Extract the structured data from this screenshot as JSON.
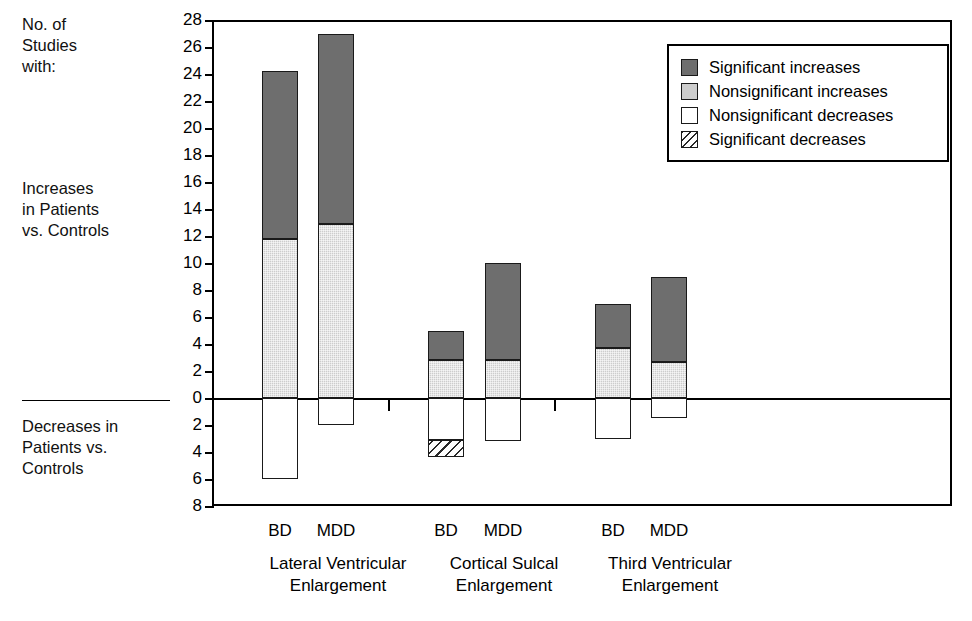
{
  "annotations": {
    "top_label": "No. of\nStudies\nwith:",
    "middle_label": "Increases\nin Patients\nvs. Controls",
    "bottom_label": "Decreases in\nPatients vs.\nControls"
  },
  "legend": {
    "position": "top-right",
    "items": [
      {
        "label": "Significant increases",
        "key": "sig-inc",
        "color": "#6e6e6e"
      },
      {
        "label": "Nonsignificant increases",
        "key": "nonsig-inc",
        "color": "#cdcdcd"
      },
      {
        "label": "Nonsignificant decreases",
        "key": "nonsig-dec",
        "color": "#ffffff"
      },
      {
        "label": "Significant decreases",
        "key": "sig-dec",
        "color": "#ffffff"
      }
    ]
  },
  "chart_data": {
    "type": "bar",
    "stacked": true,
    "title": "",
    "xlabel": "",
    "ylabel": "No. of Studies with:",
    "ylim": [
      -8,
      28
    ],
    "ytick_step": 2,
    "ytick_labels": [
      "28",
      "26",
      "24",
      "22",
      "20",
      "18",
      "16",
      "14",
      "12",
      "10",
      "8",
      "6",
      "4",
      "2",
      "0",
      "2",
      "4",
      "6",
      "8"
    ],
    "ytick_values": [
      28,
      26,
      24,
      22,
      20,
      18,
      16,
      14,
      12,
      10,
      8,
      6,
      4,
      2,
      0,
      -2,
      -4,
      -6,
      -8
    ],
    "grid": false,
    "axis_note_up": "Increases in Patients vs. Controls",
    "axis_note_down": "Decreases in Patients vs. Controls",
    "groups": [
      {
        "name": "Lateral Ventricular Enlargement",
        "label": "Lateral Ventricular\nEnlargement",
        "bars": [
          {
            "category": "BD",
            "segments": [
              {
                "series": "Nonsignificant increases",
                "key": "nonsig-inc",
                "value": 11.8
              },
              {
                "series": "Significant increases",
                "key": "sig-inc",
                "value": 12.4
              },
              {
                "series": "Nonsignificant decreases",
                "key": "nonsig-dec",
                "value": -6.0
              },
              {
                "series": "Significant decreases",
                "key": "sig-dec",
                "value": 0
              }
            ],
            "total_increase": 24.2,
            "total_decrease": -6.0
          },
          {
            "category": "MDD",
            "segments": [
              {
                "series": "Nonsignificant increases",
                "key": "nonsig-inc",
                "value": 12.9
              },
              {
                "series": "Significant increases",
                "key": "sig-inc",
                "value": 14.1
              },
              {
                "series": "Nonsignificant decreases",
                "key": "nonsig-dec",
                "value": -2.0
              },
              {
                "series": "Significant decreases",
                "key": "sig-dec",
                "value": 0
              }
            ],
            "total_increase": 27.0,
            "total_decrease": -2.0
          }
        ]
      },
      {
        "name": "Cortical Sulcal Enlargement",
        "label": "Cortical Sulcal\nEnlargement",
        "bars": [
          {
            "category": "BD",
            "segments": [
              {
                "series": "Nonsignificant increases",
                "key": "nonsig-inc",
                "value": 2.8
              },
              {
                "series": "Significant increases",
                "key": "sig-inc",
                "value": 2.2
              },
              {
                "series": "Nonsignificant decreases",
                "key": "nonsig-dec",
                "value": -3.1
              },
              {
                "series": "Significant decreases",
                "key": "sig-dec",
                "value": -1.3
              }
            ],
            "total_increase": 5.0,
            "total_decrease": -4.4
          },
          {
            "category": "MDD",
            "segments": [
              {
                "series": "Nonsignificant increases",
                "key": "nonsig-inc",
                "value": 2.8
              },
              {
                "series": "Significant increases",
                "key": "sig-inc",
                "value": 7.2
              },
              {
                "series": "Nonsignificant decreases",
                "key": "nonsig-dec",
                "value": -3.2
              },
              {
                "series": "Significant decreases",
                "key": "sig-dec",
                "value": 0
              }
            ],
            "total_increase": 10.0,
            "total_decrease": -3.2
          }
        ]
      },
      {
        "name": "Third Ventricular Enlargement",
        "label": "Third Ventricular\nEnlargement",
        "bars": [
          {
            "category": "BD",
            "segments": [
              {
                "series": "Nonsignificant increases",
                "key": "nonsig-inc",
                "value": 3.7
              },
              {
                "series": "Significant increases",
                "key": "sig-inc",
                "value": 3.3
              },
              {
                "series": "Nonsignificant decreases",
                "key": "nonsig-dec",
                "value": -3.0
              },
              {
                "series": "Significant decreases",
                "key": "sig-dec",
                "value": 0
              }
            ],
            "total_increase": 7.0,
            "total_decrease": -3.0
          },
          {
            "category": "MDD",
            "segments": [
              {
                "series": "Nonsignificant increases",
                "key": "nonsig-inc",
                "value": 2.7
              },
              {
                "series": "Significant increases",
                "key": "sig-inc",
                "value": 6.3
              },
              {
                "series": "Nonsignificant decreases",
                "key": "nonsig-dec",
                "value": -1.5
              },
              {
                "series": "Significant decreases",
                "key": "sig-dec",
                "value": 0
              }
            ],
            "total_increase": 9.0,
            "total_decrease": -1.5
          }
        ]
      }
    ]
  }
}
